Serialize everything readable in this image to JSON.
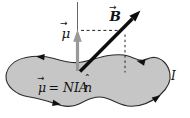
{
  "diagram": {
    "type": "magnetic-moment-of-current-loop",
    "loop": {
      "current_label": "I"
    },
    "mu_vector": {
      "label": "μ",
      "arrow_glyph": "→"
    },
    "b_vector": {
      "label": "B",
      "arrow_glyph": "→"
    },
    "equation": {
      "mu": "μ",
      "mu_arrow": "→",
      "middle": "= NIA",
      "n": "n",
      "hat": "ˆ"
    },
    "colors": {
      "background": "#ffffff",
      "loop_fill": "#c6c6c6",
      "loop_stroke": "#2b2b2b",
      "mu_arrow": "#999999",
      "b_arrow": "#0d0d0d",
      "axis_line": "#555555",
      "dashed_line": "#222222",
      "current_arrow": "#111111"
    }
  }
}
